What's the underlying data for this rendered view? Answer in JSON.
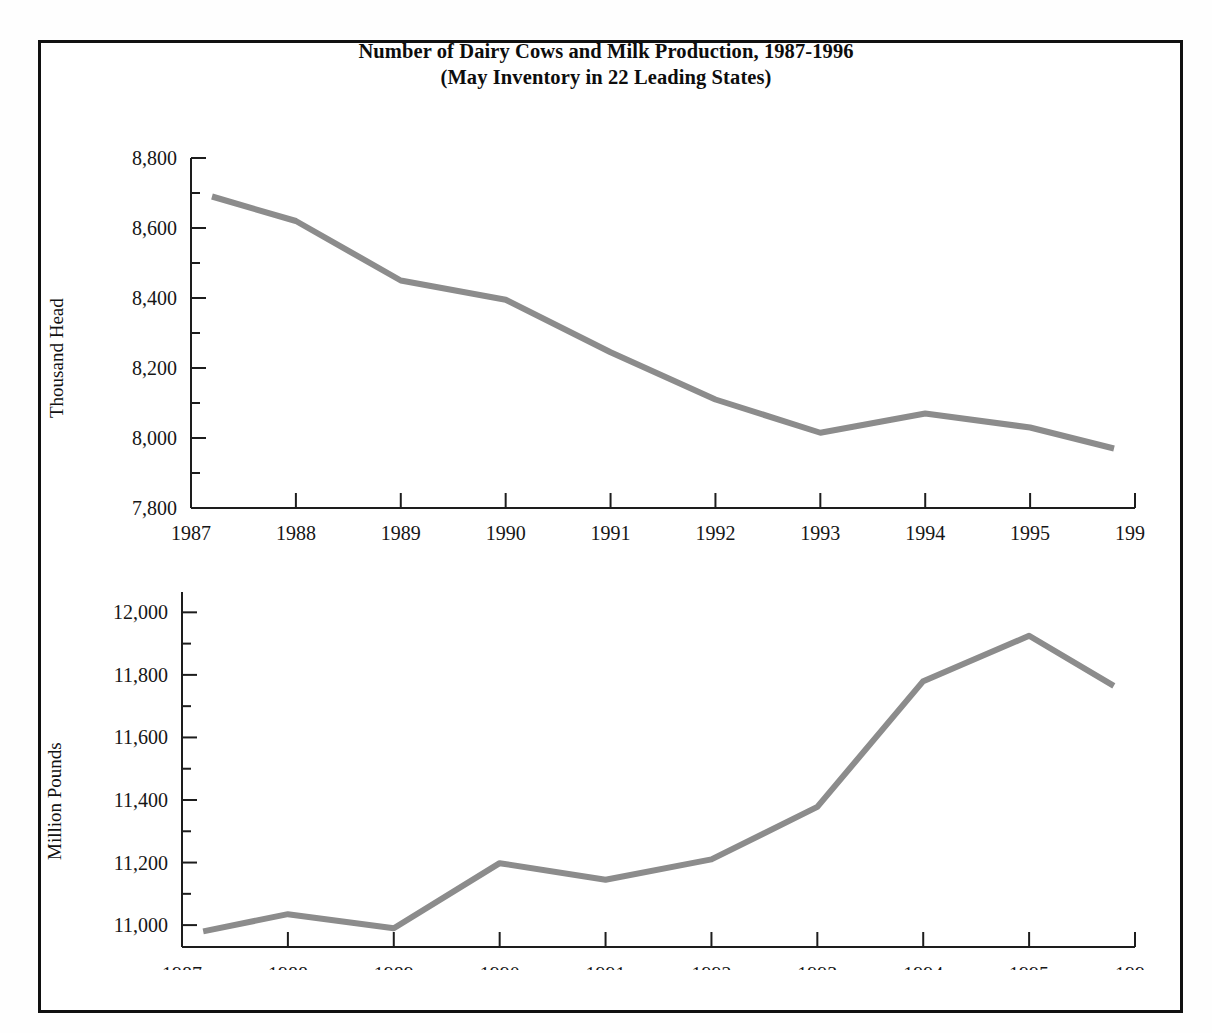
{
  "figure": {
    "title_line1": "Number of Dairy Cows and Milk Production, 1987-1996",
    "title_line2": "(May Inventory in 22 Leading States)",
    "line_color": "#8c8c8c",
    "axis_color": "#1d1d1d",
    "frame_color": "#111111",
    "background": "#ffffff"
  },
  "chart_data": [
    {
      "type": "line",
      "id": "dairy-cows",
      "title": "Number of Dairy Cows and Milk Production, 1987-1996",
      "subtitle": "(May Inventory in 22 Leading States)",
      "xlabel": "",
      "ylabel": "Thousand Head",
      "x": [
        1987.2,
        1988,
        1989,
        1990,
        1991,
        1992,
        1993,
        1994,
        1995,
        1995.8
      ],
      "values": [
        8690,
        8620,
        8450,
        8395,
        8245,
        8110,
        8015,
        8070,
        8030,
        7970
      ],
      "xtick_labels": [
        "1987",
        "1988",
        "1989",
        "1990",
        "1991",
        "1992",
        "1993",
        "1994",
        "1995",
        "1996"
      ],
      "xticks": [
        1987,
        1988,
        1989,
        1990,
        1991,
        1992,
        1993,
        1994,
        1995,
        1996
      ],
      "ytick_labels": [
        "7,800",
        "8,000",
        "8,200",
        "8,400",
        "8,600",
        "8,800"
      ],
      "yticks": [
        7800,
        8000,
        8200,
        8400,
        8600,
        8800
      ],
      "yminor_step": 100,
      "xlim": [
        1987,
        1996
      ],
      "ylim": [
        7800,
        8800
      ],
      "grid": false,
      "legend": "none",
      "units": "Thousand Head"
    },
    {
      "type": "line",
      "id": "milk-production",
      "title": "",
      "xlabel": "",
      "ylabel": "Million Pounds",
      "x": [
        1987.2,
        1988,
        1989,
        1990,
        1991,
        1992,
        1993,
        1994,
        1995,
        1995.8
      ],
      "values": [
        10980,
        11035,
        10990,
        11198,
        11145,
        11210,
        11378,
        11780,
        11925,
        11765
      ],
      "xtick_labels": [
        "1987",
        "1988",
        "1989",
        "1990",
        "1991",
        "1992",
        "1993",
        "1994",
        "1995",
        "1996"
      ],
      "xticks": [
        1987,
        1988,
        1989,
        1990,
        1991,
        1992,
        1993,
        1994,
        1995,
        1996
      ],
      "ytick_labels": [
        "11,000",
        "11,200",
        "11,400",
        "11,600",
        "11,800",
        "12,000"
      ],
      "yticks": [
        11000,
        11200,
        11400,
        11600,
        11800,
        12000
      ],
      "yminor_step": 100,
      "xlim": [
        1987,
        1996
      ],
      "ylim": [
        10930,
        12065
      ],
      "grid": false,
      "legend": "none",
      "units": "Million Pounds"
    }
  ]
}
